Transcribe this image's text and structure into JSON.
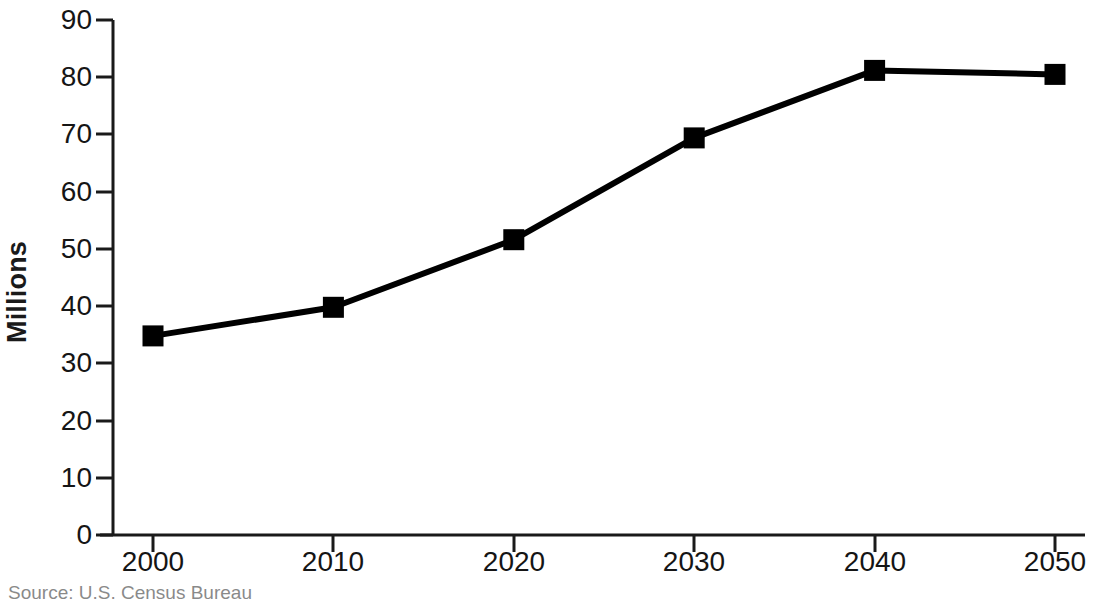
{
  "chart_data": {
    "type": "line",
    "title": "",
    "xlabel": "",
    "ylabel": "Millions",
    "categories": [
      "2000",
      "2010",
      "2020",
      "2030",
      "2040",
      "2050"
    ],
    "x": [
      2000,
      2010,
      2020,
      2030,
      2040,
      2050
    ],
    "values": [
      34.8,
      39.8,
      51.6,
      69.4,
      81.2,
      80.5
    ],
    "series": [
      {
        "name": "Millions",
        "values": [
          34.8,
          39.8,
          51.6,
          69.4,
          81.2,
          80.5
        ]
      }
    ],
    "ylim": [
      0,
      90
    ],
    "xlim": [
      2000,
      2050
    ],
    "ytick_labels": [
      "0",
      "10",
      "20",
      "30",
      "40",
      "50",
      "60",
      "70",
      "80",
      "90"
    ],
    "ytick_values": [
      0,
      10,
      20,
      30,
      40,
      50,
      60,
      70,
      80,
      90
    ],
    "xtick_labels": [
      "2000",
      "2010",
      "2020",
      "2030",
      "2040",
      "2050"
    ],
    "grid": false,
    "legend": false,
    "legend_position": "none",
    "marker": "square",
    "line_color": "#000000",
    "marker_color": "#000000",
    "axis_color": "#1a1a1a",
    "background_color": "#ffffff",
    "annotations": []
  },
  "source_note": {
    "text": "Source:  U.S. Census Bureau"
  }
}
